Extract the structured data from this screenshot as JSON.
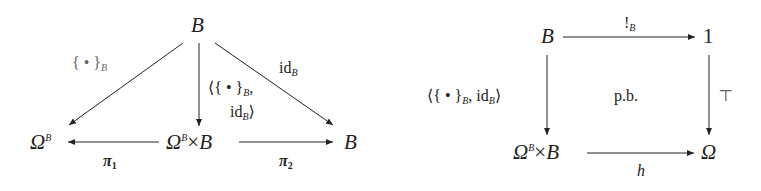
{
  "left_diagram": {
    "objects": {
      "top": {
        "base": "B"
      },
      "left": {
        "base": "Ω",
        "sup": "B"
      },
      "center": {
        "base": "Ω",
        "sup": "B",
        "op": "×",
        "rest": "B"
      },
      "right": {
        "base": "B"
      }
    },
    "arrows": {
      "top_left": {
        "pre": "{ • }",
        "sub": "B"
      },
      "top_center": {
        "line1_pre": "⟨{ • }",
        "line1_sub": "B",
        "line1_post": ",",
        "line2_pre": "id",
        "line2_sub": "B",
        "line2_post": "⟩"
      },
      "top_right": {
        "pre": "id",
        "sub": "B"
      },
      "center_left": {
        "pre": "π",
        "sub": "1"
      },
      "center_right": {
        "pre": "π",
        "sub": "2"
      }
    }
  },
  "right_diagram": {
    "objects": {
      "top_left": {
        "base": "B"
      },
      "top_right": {
        "base": "1"
      },
      "bottom_left": {
        "base": "Ω",
        "sup": "B",
        "op": "×",
        "rest": "B"
      },
      "bottom_right": {
        "base": "Ω"
      }
    },
    "arrows": {
      "top": {
        "pre": "!",
        "sub": "B"
      },
      "left": {
        "pre": "⟨{ • }",
        "sub": "B",
        "mid": ", id",
        "sub2": "B",
        "post": "⟩"
      },
      "right": {
        "pre": "⊤"
      },
      "bottom": {
        "pre": "h"
      }
    },
    "center_label": "p.b."
  }
}
